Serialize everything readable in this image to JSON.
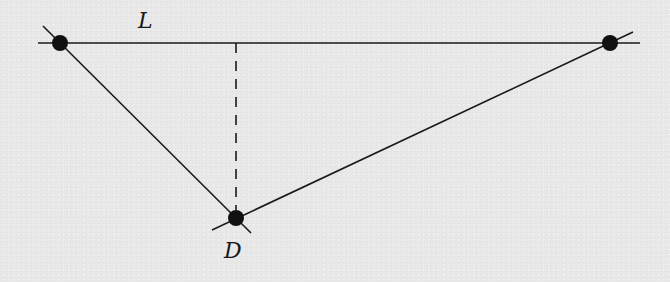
{
  "diagram": {
    "colors": {
      "background": "#e8e8e8",
      "ink": "#1a1a1a"
    },
    "line_L": {
      "label": "L",
      "x1": 38,
      "y1": 43,
      "x2": 640,
      "y2": 43,
      "label_x": 138,
      "label_y": 28
    },
    "points": [
      {
        "id": "left-point",
        "cx": 60,
        "cy": 43,
        "r": 8
      },
      {
        "id": "right-point",
        "cx": 610,
        "cy": 43,
        "r": 8
      },
      {
        "id": "point-D",
        "cx": 236,
        "cy": 218,
        "r": 8,
        "label": "D",
        "label_x": 224,
        "label_y": 258
      }
    ],
    "segments": [
      {
        "id": "left-to-D",
        "x1": 43,
        "y1": 26,
        "x2": 251,
        "y2": 233
      },
      {
        "id": "right-to-D",
        "x1": 633,
        "y1": 32,
        "x2": 212,
        "y2": 230
      }
    ],
    "perpendicular": {
      "x1": 236,
      "y1": 43,
      "x2": 236,
      "y2": 210,
      "dash": "10 8"
    },
    "labels": {
      "L": "L",
      "D": "D"
    }
  }
}
